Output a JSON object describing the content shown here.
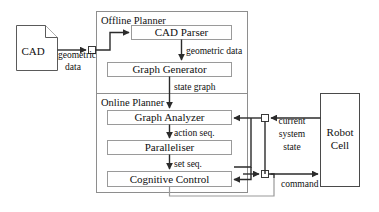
{
  "diagram": {
    "sections": [
      {
        "id": "offline",
        "label": "Offline Planner"
      },
      {
        "id": "online",
        "label": "Online Planner"
      }
    ],
    "source_document": {
      "label": "CAD",
      "icon": "document-icon"
    },
    "process_boxes": [
      {
        "id": "cad-parser",
        "label": "CAD Parser"
      },
      {
        "id": "graph-generator",
        "label": "Graph Generator"
      },
      {
        "id": "graph-analyzer",
        "label": "Graph Analyzer"
      },
      {
        "id": "paralleliser",
        "label": "Paralleliser"
      },
      {
        "id": "cognitive-control",
        "label": "Cognitive Control"
      }
    ],
    "external_boxes": [
      {
        "id": "robot-cell",
        "label_line1": "Robot",
        "label_line2": "Cell"
      }
    ],
    "edge_labels": [
      {
        "id": "geometric-data-source",
        "line1": "geometric",
        "line2": "data"
      },
      {
        "id": "geometric-data",
        "text": "geometric data"
      },
      {
        "id": "state-graph",
        "text": "state graph"
      },
      {
        "id": "action-seq",
        "text": "action seq."
      },
      {
        "id": "set-seq",
        "text": "set seq."
      },
      {
        "id": "current-system-state",
        "line1": "current",
        "line2": "system",
        "line3": "state"
      },
      {
        "id": "command",
        "text": "command"
      }
    ],
    "colors": {
      "background": "#ffffff",
      "box_stroke": "#9a9a9a",
      "frame_stroke": "#8e8e8e",
      "arrow": "#2b2b2b",
      "text": "#101010"
    }
  }
}
